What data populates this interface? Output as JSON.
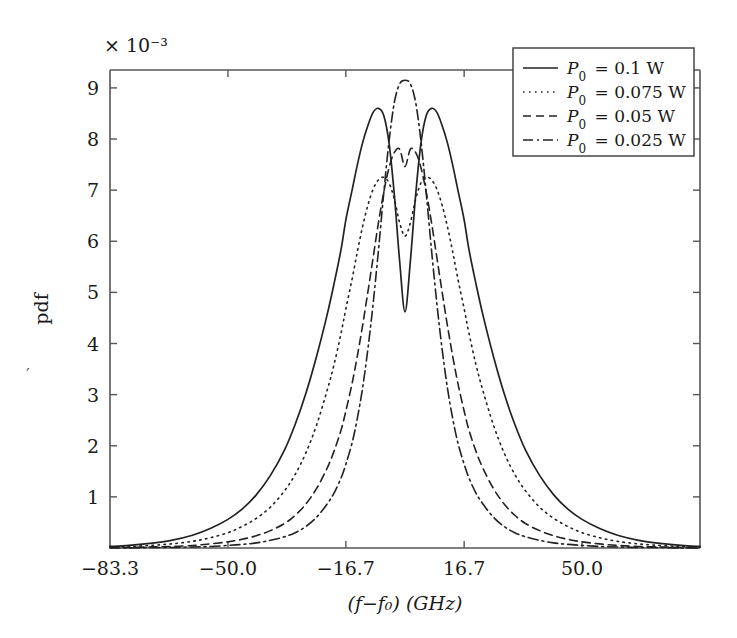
{
  "chart_data": {
    "type": "line",
    "title": "",
    "xlabel": "(f−f₀) (GHz)",
    "ylabel": "pdf",
    "y_multiplier": "× 10⁻³",
    "y_multiplier_value": 0.001,
    "xlim": [
      -83.3,
      83.3
    ],
    "ylim": [
      0,
      9.35
    ],
    "xticks": [
      -83.3,
      -50.0,
      -16.7,
      16.7,
      50.0
    ],
    "xticklabels": [
      "−83.3",
      "−50.0",
      "−16.7",
      "16.7",
      "50.0"
    ],
    "yticks": [
      1,
      2,
      3,
      4,
      5,
      6,
      7,
      8,
      9
    ],
    "yticklabels": [
      "1",
      "2",
      "3",
      "4",
      "5",
      "6",
      "7",
      "8",
      "9"
    ],
    "grid": false,
    "legend_position": "top-right",
    "x": [
      -83.3,
      -78.0,
      -72.0,
      -66.0,
      -60.0,
      -55.0,
      -50.0,
      -46.0,
      -42.0,
      -38.0,
      -34.0,
      -31.0,
      -28.0,
      -25.0,
      -22.0,
      -20.0,
      -18.0,
      -16.7,
      -15.0,
      -13.5,
      -12.0,
      -10.5,
      -9.0,
      -7.5,
      -6.0,
      -4.5,
      -3.0,
      -1.5,
      0.0,
      1.5,
      3.0,
      4.5,
      6.0,
      7.5,
      9.0,
      10.5,
      12.0,
      13.5,
      15.0,
      16.7,
      18.0,
      20.0,
      22.0,
      25.0,
      28.0,
      31.0,
      34.0,
      38.0,
      42.0,
      46.0,
      50.0,
      55.0,
      60.0,
      66.0,
      72.0,
      78.0,
      83.3
    ],
    "series": [
      {
        "name": "P₀ = 0.1 W",
        "label_parts": {
          "symbol": "P",
          "subscript": "0",
          "equals": "=",
          "value": "0.1",
          "unit": "W"
        },
        "style": "solid",
        "color": "#222222",
        "peak_value": 8.6,
        "peak_positions": [
          -10.5,
          10.5
        ],
        "center_dip_value": 4.6,
        "values": [
          0.03,
          0.05,
          0.09,
          0.15,
          0.25,
          0.38,
          0.56,
          0.76,
          1.04,
          1.42,
          1.92,
          2.42,
          3.02,
          3.74,
          4.56,
          5.18,
          5.86,
          6.42,
          6.98,
          7.48,
          7.92,
          8.26,
          8.52,
          8.6,
          8.46,
          7.92,
          6.9,
          5.6,
          4.62,
          5.6,
          6.9,
          7.92,
          8.46,
          8.6,
          8.52,
          8.26,
          7.92,
          7.48,
          6.98,
          6.42,
          5.86,
          5.18,
          4.56,
          3.74,
          3.02,
          2.42,
          1.92,
          1.42,
          1.04,
          0.76,
          0.56,
          0.38,
          0.25,
          0.15,
          0.09,
          0.05,
          0.03
        ]
      },
      {
        "name": "P₀ = 0.075 W",
        "label_parts": {
          "symbol": "P",
          "subscript": "0",
          "equals": "=",
          "value": "0.075",
          "unit": "W"
        },
        "style": "dotted",
        "color": "#222222",
        "peak_value": 7.25,
        "peak_positions": [
          -7.0,
          7.0
        ],
        "center_dip_value": 6.1,
        "values": [
          0.02,
          0.03,
          0.05,
          0.08,
          0.13,
          0.2,
          0.3,
          0.42,
          0.58,
          0.8,
          1.12,
          1.44,
          1.86,
          2.4,
          3.08,
          3.6,
          4.22,
          4.68,
          5.24,
          5.78,
          6.28,
          6.7,
          7.02,
          7.2,
          7.25,
          7.14,
          6.82,
          6.36,
          6.1,
          6.36,
          6.82,
          7.14,
          7.25,
          7.2,
          7.02,
          6.7,
          6.28,
          5.78,
          5.24,
          4.68,
          4.22,
          3.6,
          3.08,
          2.4,
          1.86,
          1.44,
          1.12,
          0.8,
          0.58,
          0.42,
          0.3,
          0.2,
          0.13,
          0.08,
          0.05,
          0.03,
          0.02
        ]
      },
      {
        "name": "P₀ = 0.05 W",
        "label_parts": {
          "symbol": "P",
          "subscript": "0",
          "equals": "=",
          "value": "0.05",
          "unit": "W"
        },
        "style": "dashed",
        "color": "#222222",
        "peak_value": 7.8,
        "peak_positions": [
          -3.2,
          3.2
        ],
        "center_dip_value": 7.45,
        "values": [
          0.01,
          0.01,
          0.02,
          0.03,
          0.05,
          0.08,
          0.12,
          0.17,
          0.24,
          0.34,
          0.48,
          0.64,
          0.86,
          1.16,
          1.56,
          1.9,
          2.32,
          2.68,
          3.2,
          3.74,
          4.34,
          5.0,
          5.68,
          6.36,
          6.96,
          7.44,
          7.74,
          7.8,
          7.46,
          7.8,
          7.74,
          7.44,
          6.96,
          6.36,
          5.68,
          5.0,
          4.34,
          3.74,
          3.2,
          2.68,
          2.32,
          1.9,
          1.56,
          1.16,
          0.86,
          0.64,
          0.48,
          0.34,
          0.24,
          0.17,
          0.12,
          0.08,
          0.05,
          0.03,
          0.02,
          0.01,
          0.01
        ]
      },
      {
        "name": "P₀ = 0.025 W",
        "label_parts": {
          "symbol": "P",
          "subscript": "0",
          "equals": "=",
          "value": "0.025",
          "unit": "W"
        },
        "style": "dashdot",
        "color": "#222222",
        "peak_value": 9.15,
        "peak_positions": [
          0.0
        ],
        "center_dip_value": 9.15,
        "values": [
          0.0,
          0.0,
          0.01,
          0.01,
          0.02,
          0.03,
          0.05,
          0.07,
          0.1,
          0.15,
          0.22,
          0.3,
          0.42,
          0.6,
          0.86,
          1.08,
          1.38,
          1.64,
          2.04,
          2.52,
          3.12,
          3.88,
          4.78,
          5.82,
          6.94,
          7.96,
          8.72,
          9.08,
          9.15,
          9.08,
          8.72,
          7.96,
          6.94,
          5.82,
          4.78,
          3.88,
          3.12,
          2.52,
          2.04,
          1.64,
          1.38,
          1.08,
          0.86,
          0.6,
          0.42,
          0.3,
          0.22,
          0.15,
          0.1,
          0.07,
          0.05,
          0.03,
          0.02,
          0.01,
          0.01,
          0.0,
          0.0
        ]
      }
    ]
  },
  "legend": {
    "entries": [
      {
        "label": "P₀ = 0.1 W",
        "style": "solid"
      },
      {
        "label": "P₀ = 0.075 W",
        "style": "dotted"
      },
      {
        "label": "P₀ = 0.05 W",
        "style": "dashed"
      },
      {
        "label": "P₀ = 0.025 W",
        "style": "dashdot"
      }
    ]
  },
  "artifacts": {
    "stray_mark": "′"
  }
}
